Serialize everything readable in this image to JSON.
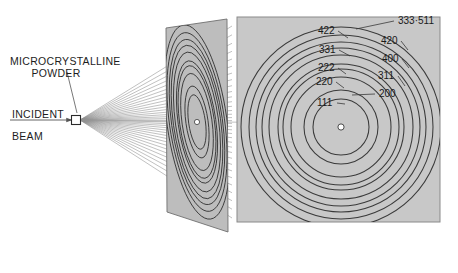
{
  "figure": {
    "kind": "x-ray-powder-diffraction-debye-scherrer-diagram",
    "labels": {
      "powder_line1": "MICROCRYSTALLINE",
      "powder_line2": "POWDER",
      "incident": "INCIDENT",
      "beam": "BEAM"
    }
  },
  "colors": {
    "film_fill": "#c8c8c8",
    "film_edge": "#7d7d7d",
    "tilted_fill": "#bdbdbd",
    "ring_stroke": "#3a3a3a",
    "ray_stroke": "#8d8d8d",
    "text": "#1d1d1d",
    "center_dot": "#ffffff"
  },
  "chart_data": {
    "type": "scatter",
    "title": "",
    "xlabel": "",
    "ylabel": "",
    "center": {
      "x": 341,
      "y": 127
    },
    "rings": [
      {
        "index": "111",
        "radius": 28
      },
      {
        "index": "200",
        "radius": 37
      },
      {
        "index": "220",
        "radius": 50
      },
      {
        "index": "311",
        "radius": 58
      },
      {
        "index": "222",
        "radius": 63
      },
      {
        "index": "400",
        "radius": 72
      },
      {
        "index": "331",
        "radius": 79
      },
      {
        "index": "420",
        "radius": 85
      },
      {
        "index": "422",
        "radius": 92
      },
      {
        "index": "333-511",
        "radius": 100
      }
    ],
    "ring_labels": [
      {
        "text": "333·511",
        "x": 398,
        "y": 24,
        "leader_to_x": 356,
        "leader_to_y": 29
      },
      {
        "text": "422",
        "x": 318,
        "y": 34,
        "leader_to_x": 348,
        "leader_to_y": 38
      },
      {
        "text": "420",
        "x": 381,
        "y": 44,
        "leader_to_x": 408,
        "leader_to_y": 50
      },
      {
        "text": "331",
        "x": 319,
        "y": 53,
        "leader_to_x": 350,
        "leader_to_y": 56
      },
      {
        "text": "400",
        "x": 382,
        "y": 62,
        "leader_to_x": 409,
        "leader_to_y": 68
      },
      {
        "text": "222",
        "x": 318,
        "y": 71,
        "leader_to_x": 346,
        "leader_to_y": 74
      },
      {
        "text": "311",
        "x": 378,
        "y": 79,
        "leader_to_x": 405,
        "leader_to_y": 86
      },
      {
        "text": "220",
        "x": 316,
        "y": 85,
        "leader_to_x": 344,
        "leader_to_y": 88
      },
      {
        "text": "200",
        "x": 379,
        "y": 97,
        "leader_to_x": 352,
        "leader_to_y": 95
      },
      {
        "text": "111",
        "x": 317,
        "y": 106,
        "leader_to_x": 345,
        "leader_to_y": 104
      }
    ],
    "film_panel": {
      "x": 237,
      "y": 17,
      "width": 203,
      "height": 205
    },
    "tilted_panel": {
      "points": "166,28 227,19 228,232 167,212",
      "center": {
        "x": 197,
        "y": 122
      }
    },
    "sample": {
      "x": 76,
      "y": 120,
      "size": 9
    },
    "incident_beam": {
      "from_x": 10,
      "to_x": 72,
      "y": 120
    },
    "diffracted_ray_count": 34
  }
}
